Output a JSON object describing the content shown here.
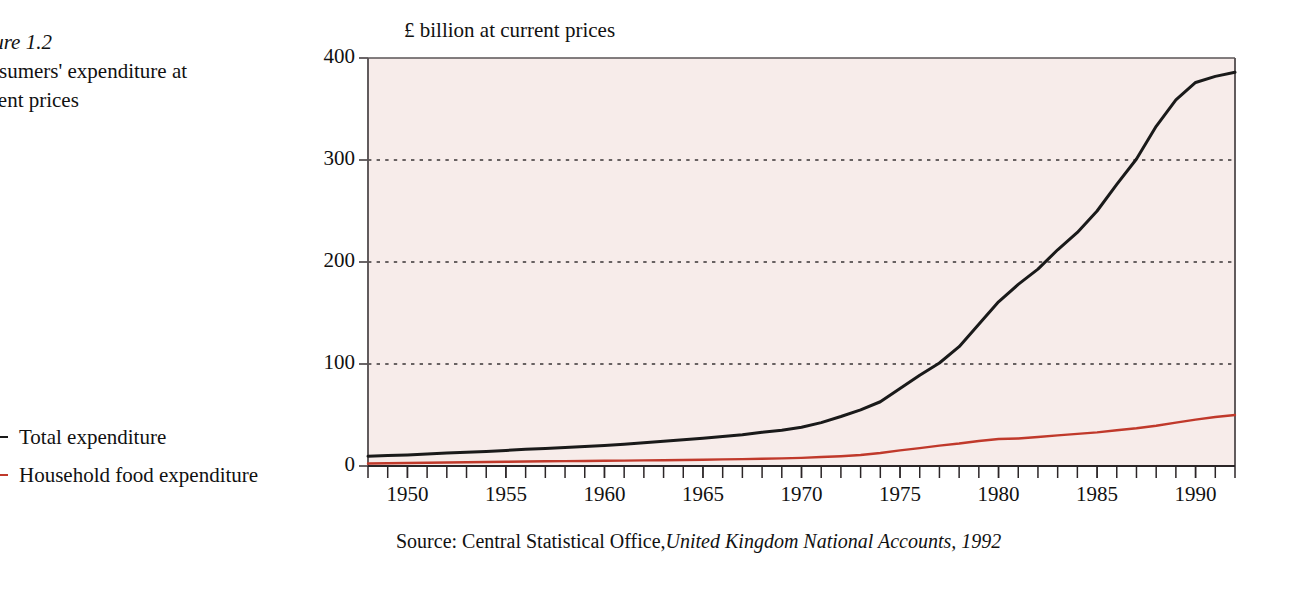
{
  "caption": {
    "figure_number": "Figure 1.2",
    "title_line1": "Consumers' expenditure at",
    "title_line2": "current prices"
  },
  "legend": {
    "items": [
      {
        "label": "Total expenditure",
        "color": "#1a1a1a",
        "dash": "solid"
      },
      {
        "label": "Household food expenditure",
        "color": "#c0392b",
        "dash": "solid"
      }
    ]
  },
  "source": {
    "prefix": "Source: Central Statistical Office,",
    "publication": "United Kingdom National Accounts, 1992"
  },
  "colors": {
    "plot_background": "#f7ecea",
    "axis": "#5a5456",
    "gridline": "#3a3436",
    "total_expenditure": "#1a1a1a",
    "food_expenditure": "#c0392b",
    "page_background": "#ffffff"
  },
  "chart_data": {
    "type": "line",
    "title": "£ billion at current prices",
    "xlabel": "",
    "ylabel": "£ billion at current prices",
    "xlim": [
      1948,
      1992
    ],
    "ylim": [
      0,
      400
    ],
    "yticks": [
      0,
      100,
      200,
      300,
      400
    ],
    "ytick_labels": [
      "0",
      "100",
      "200",
      "300",
      "400"
    ],
    "xticks": [
      1950,
      1955,
      1960,
      1965,
      1970,
      1975,
      1980,
      1985,
      1990
    ],
    "xtick_labels": [
      "1950",
      "1955",
      "1960",
      "1965",
      "1970",
      "1975",
      "1980",
      "1985",
      "1990"
    ],
    "minor_xticks_every": 1,
    "grid": "horizontal-dotted",
    "legend_position": "left-outside",
    "x": [
      1948,
      1949,
      1950,
      1951,
      1952,
      1953,
      1954,
      1955,
      1956,
      1957,
      1958,
      1959,
      1960,
      1961,
      1962,
      1963,
      1964,
      1965,
      1966,
      1967,
      1968,
      1969,
      1970,
      1971,
      1972,
      1973,
      1974,
      1975,
      1976,
      1977,
      1978,
      1979,
      1980,
      1981,
      1982,
      1983,
      1984,
      1985,
      1986,
      1987,
      1988,
      1989,
      1990,
      1991,
      1992
    ],
    "series": [
      {
        "name": "Total expenditure",
        "color": "#1a1a1a",
        "values": [
          9.5,
          10.2,
          10.8,
          11.8,
          12.7,
          13.5,
          14.3,
          15.3,
          16.3,
          17.2,
          18.1,
          19.1,
          20.2,
          21.4,
          22.7,
          24.2,
          25.8,
          27.3,
          29.0,
          30.6,
          33.0,
          35.0,
          38.0,
          42.5,
          48.5,
          55.0,
          63.0,
          76.0,
          89.0,
          101.0,
          117.0,
          139.0,
          161.0,
          178.0,
          193.0,
          212.0,
          229.0,
          250.0,
          276.0,
          301.0,
          333.0,
          359.0,
          376.0,
          382.0,
          386.0
        ]
      },
      {
        "name": "Household food expenditure",
        "color": "#c0392b",
        "values": [
          2.5,
          2.7,
          2.9,
          3.2,
          3.5,
          3.7,
          3.9,
          4.1,
          4.4,
          4.6,
          4.8,
          4.9,
          5.1,
          5.3,
          5.5,
          5.7,
          5.9,
          6.2,
          6.5,
          6.7,
          7.1,
          7.5,
          8.0,
          8.8,
          9.6,
          10.8,
          12.8,
          15.3,
          17.5,
          20.0,
          22.0,
          24.5,
          26.5,
          27.0,
          28.5,
          30.0,
          31.5,
          33.0,
          35.0,
          37.0,
          39.5,
          42.5,
          45.5,
          48.0,
          50.0
        ]
      }
    ]
  }
}
